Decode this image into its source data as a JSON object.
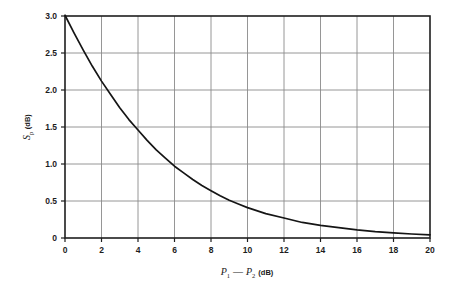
{
  "figure": {
    "background_color": "#ffffff",
    "plot_border_color": "#1f1f1f",
    "grid_color": "#8a8a8a",
    "curve_color": "#151515"
  },
  "axes": {
    "y_title_symbol": "S",
    "y_title_subscript": "p",
    "y_title_unit": "(dB)",
    "y_title_full": "Sₚ (dB)",
    "x_title_symbol_1": "P",
    "x_title_subscript_1": "1",
    "x_title_minus": "—",
    "x_title_symbol_2": "P",
    "x_title_subscript_2": "2",
    "x_title_unit": "(dB)",
    "x_title_full": "P₁ — P₂ (dB)"
  },
  "chart_data": {
    "type": "line",
    "title": "",
    "xlabel": "P₁ — P₂ (dB)",
    "ylabel": "Sₚ (dB)",
    "xlim": [
      0,
      20
    ],
    "ylim": [
      0,
      3.0
    ],
    "grid": true,
    "legend": "none",
    "x_ticks": [
      0,
      2,
      4,
      6,
      8,
      10,
      12,
      14,
      16,
      18,
      20
    ],
    "x_tick_labels": [
      "0",
      "2",
      "4",
      "6",
      "8",
      "10",
      "12",
      "14",
      "16",
      "18",
      "20"
    ],
    "y_ticks": [
      0,
      0.5,
      1.0,
      1.5,
      2.0,
      2.5,
      3.0
    ],
    "y_tick_labels": [
      "0",
      "0.5",
      "1.0",
      "1.5",
      "2.0",
      "2.5",
      "3.0"
    ],
    "series": [
      {
        "name": "decibel-addition-correction",
        "formula": "S_p = 10*log10(1 + 10^(-(P1-P2)/10))",
        "x": [
          0,
          0.5,
          1,
          1.5,
          2,
          2.5,
          3,
          3.5,
          4,
          4.5,
          5,
          5.5,
          6,
          6.5,
          7,
          7.5,
          8,
          8.5,
          9,
          9.5,
          10,
          11,
          12,
          13,
          14,
          15,
          16,
          17,
          18,
          19,
          20
        ],
        "values": [
          3.01,
          2.77,
          2.54,
          2.32,
          2.12,
          1.94,
          1.76,
          1.6,
          1.46,
          1.32,
          1.19,
          1.08,
          0.97,
          0.88,
          0.79,
          0.71,
          0.64,
          0.57,
          0.51,
          0.46,
          0.41,
          0.33,
          0.27,
          0.21,
          0.17,
          0.14,
          0.11,
          0.086,
          0.068,
          0.054,
          0.043
        ]
      }
    ]
  }
}
